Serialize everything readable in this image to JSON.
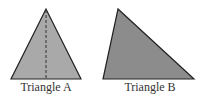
{
  "diagram": {
    "triangles": [
      {
        "id": "A",
        "label": "Triangle A",
        "fill": "#a9a9a9",
        "stroke": "#222222",
        "has_altitude_line": true
      },
      {
        "id": "B",
        "label": "Triangle B",
        "fill": "#8c8c8c",
        "stroke": "#222222",
        "has_altitude_line": false
      }
    ]
  }
}
